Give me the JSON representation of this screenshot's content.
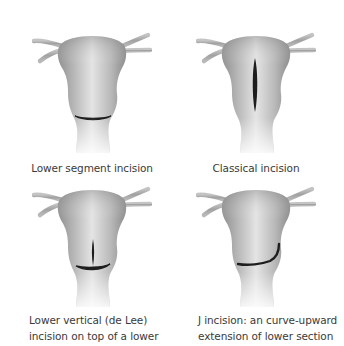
{
  "figure": {
    "panels": [
      {
        "id": "lower-segment",
        "caption_lines": [
          "Lower segment incision"
        ],
        "incision_type": "transverse-lower"
      },
      {
        "id": "classical",
        "caption_lines": [
          "Classical incision"
        ],
        "incision_type": "vertical-upper"
      },
      {
        "id": "de-lee",
        "caption_lines": [
          "Lower vertical (de Lee)",
          "incision on top of a lower"
        ],
        "incision_type": "inverted-t"
      },
      {
        "id": "j-incision",
        "caption_lines": [
          "J incision: an curve-upward",
          "extension of lower section"
        ],
        "incision_type": "j-shaped"
      }
    ],
    "colors": {
      "background": "#ffffff",
      "uterus_light": "#e6e6e6",
      "uterus_mid": "#bdbdbd",
      "uterus_dark": "#8f8f8f",
      "tube": "#a9a9a9",
      "incision": "#1e1e1e",
      "caption_text": "#3a3a3a"
    }
  }
}
